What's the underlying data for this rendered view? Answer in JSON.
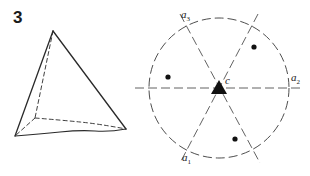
{
  "figure": {
    "number": "3",
    "left_panel": {
      "shape": "tetrahedron",
      "vertices": {
        "apex": [
          53,
          31
        ],
        "front_left": [
          15,
          136
        ],
        "front_right": [
          126,
          129
        ],
        "hidden_back": [
          35,
          118
        ]
      },
      "edges_solid": [
        [
          "apex",
          "front_left"
        ],
        [
          "apex",
          "front_right"
        ],
        [
          "front_left",
          "front_right"
        ]
      ],
      "edges_dashed": [
        [
          "apex",
          "hidden_back"
        ],
        [
          "hidden_back",
          "front_left"
        ],
        [
          "hidden_back",
          "front_right"
        ]
      ]
    },
    "right_panel": {
      "shape": "circle-with-symmetry-axes",
      "circle": {
        "cx": 219,
        "cy": 88,
        "r": 70,
        "style": "dashed"
      },
      "center_label": "c",
      "center_marker": "filled-triangle",
      "axes": [
        {
          "label": "a",
          "subscript": "1",
          "x1": 258,
          "y1": 14,
          "x2": 180,
          "y2": 163
        },
        {
          "label": "a",
          "subscript": "2",
          "x1": 135,
          "y1": 88,
          "x2": 303,
          "y2": 88
        },
        {
          "label": "a",
          "subscript": "3",
          "x1": 180,
          "y1": 14,
          "x2": 260,
          "y2": 163
        }
      ],
      "points": [
        {
          "x": 168,
          "y": 77
        },
        {
          "x": 254,
          "y": 47
        },
        {
          "x": 235,
          "y": 139
        }
      ]
    }
  },
  "colors": {
    "stroke": "#2a2a2a",
    "background": "#ffffff"
  }
}
